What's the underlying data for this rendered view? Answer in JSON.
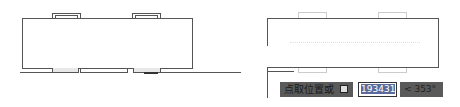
{
  "canvas": {
    "left_view": {
      "label": "original-block"
    },
    "right_view": {
      "label": "moving-block-preview"
    }
  },
  "dynamic_input": {
    "prompt_label": "点取位置或",
    "lock_icon": "lock-icon",
    "value_field": "193431",
    "angle_field": "< 353°"
  },
  "colors": {
    "line": "#555555",
    "ghost": "#d0d0d0",
    "input_bg": "#5a5a5a",
    "selection": "#5a6a9a"
  }
}
